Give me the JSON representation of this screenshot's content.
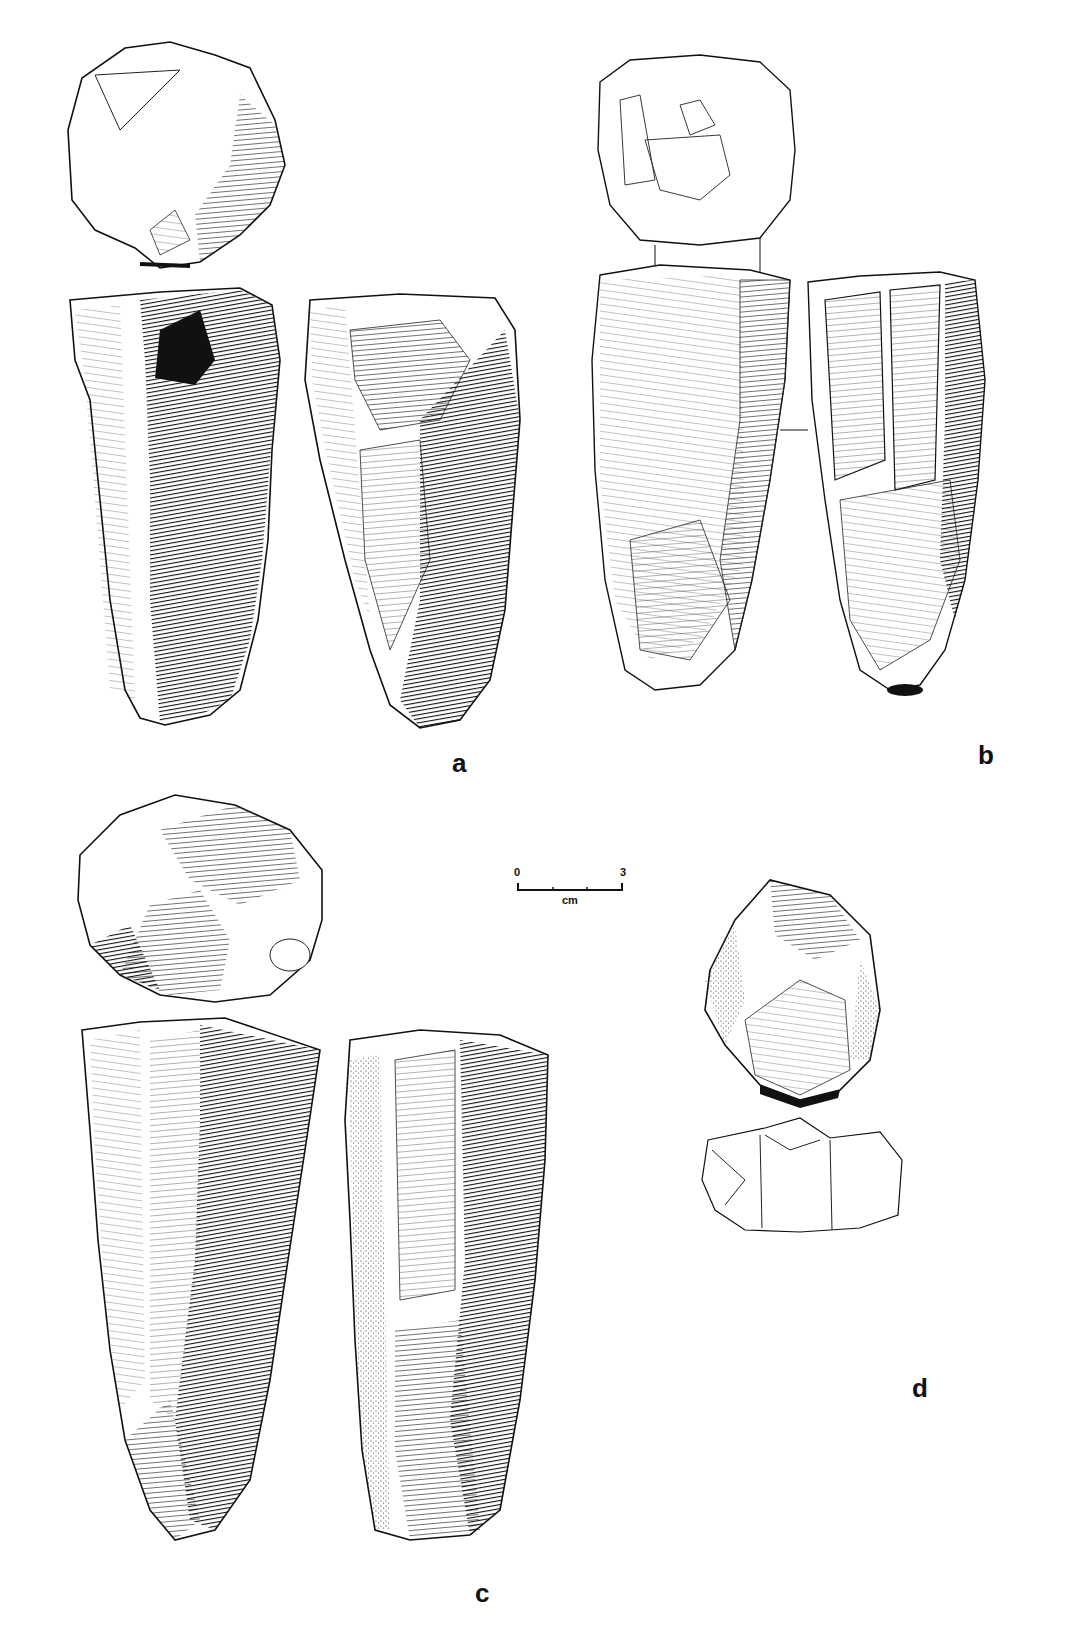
{
  "figure": {
    "labels": {
      "a": "a",
      "b": "b",
      "c": "c",
      "d": "d"
    },
    "scale_bar": {
      "start": "0",
      "end": "3",
      "unit": "cm",
      "subdivisions": 3
    },
    "artifacts": [
      {
        "id": "a",
        "views": [
          "platform-view",
          "face-view-left",
          "face-view-right"
        ],
        "style": "heavy-hatched"
      },
      {
        "id": "b",
        "views": [
          "platform-view",
          "face-view-left",
          "face-view-right"
        ],
        "style": "light-hatched"
      },
      {
        "id": "c",
        "views": [
          "platform-view",
          "face-view-left",
          "face-view-right"
        ],
        "style": "heavy-hatched"
      },
      {
        "id": "d",
        "views": [
          "face-view",
          "profile-outline"
        ],
        "style": "stippled-hatched"
      }
    ],
    "colors": {
      "ink": "#111111",
      "paper": "#ffffff"
    }
  }
}
